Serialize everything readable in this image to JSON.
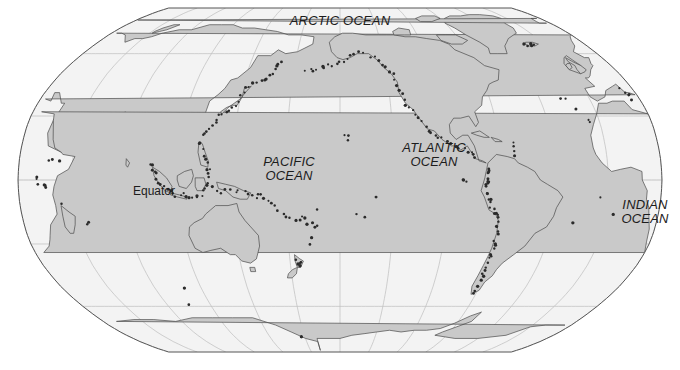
{
  "map": {
    "kind": "world-map",
    "projection": "robinson",
    "centered_on": "pacific",
    "title": "",
    "colors": {
      "background": "#ffffff",
      "ocean_fill": "#f3f3f3",
      "land_fill": "#c9c9c9",
      "land_stroke": "#4a4a4a",
      "graticule": "#bdbdbd",
      "neatline": "#555555",
      "marker": "#2b2b2b",
      "label_text": "#1c1c1c"
    },
    "graticule": {
      "visible": true,
      "parallel_interval_deg": 30,
      "meridian_interval_deg": 30,
      "parallels_deg": [
        -60,
        -30,
        0,
        30,
        60
      ],
      "meridians_deg": [
        -180,
        -150,
        -120,
        -90,
        -60,
        -30,
        0,
        30,
        60,
        90,
        120,
        150,
        180
      ]
    },
    "frame": {
      "left": 18,
      "top": 8,
      "right": 662,
      "bottom": 352,
      "neatline_visible": true
    },
    "labels": [
      {
        "id": "arctic-ocean",
        "text": "ARCTIC OCEAN",
        "style": "italic",
        "x": 340,
        "y": 14,
        "size": 13
      },
      {
        "id": "pacific-ocean",
        "text": "PACIFIC\nOCEAN",
        "style": "italic",
        "x": 289,
        "y": 155,
        "size": 13
      },
      {
        "id": "atlantic-ocean",
        "text": "ATLANTIC\nOCEAN",
        "style": "italic",
        "x": 434,
        "y": 141,
        "size": 13
      },
      {
        "id": "indian-ocean",
        "text": "INDIAN\nOCEAN",
        "style": "italic",
        "x": 645,
        "y": 198,
        "size": 13
      },
      {
        "id": "equator",
        "text": "Equator",
        "style": "plain",
        "x": 154,
        "y": 184,
        "size": 12
      }
    ],
    "features": {
      "marker_name": "volcano-ring-of-fire-dots",
      "marker_count_approx": 240,
      "continents_visible": [
        "Asia",
        "Australia",
        "North America",
        "South America",
        "Africa",
        "Europe",
        "Antarctica",
        "Greenland"
      ]
    }
  }
}
